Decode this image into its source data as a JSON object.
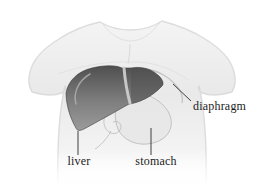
{
  "figure": {
    "type": "anatomical-torso-diagram",
    "labels": {
      "liver": "liver",
      "stomach": "stomach",
      "diaphragm": "diaphragm"
    },
    "colors": {
      "background": "#ffffff",
      "torso_light": "#f4f4f4",
      "torso_mid": "#e9e9e9",
      "torso_edge": "#d7d7d7",
      "liver_top": "#4f4f4f",
      "liver_mid": "#7e7e7e",
      "liver_bottom": "#9b9b9b",
      "liver_outline": "#3c3c3c",
      "falciform_ligament": "#cccccc",
      "liver_highlight": "#b2b2b2",
      "stomach_fill": "#e6e6e6",
      "stomach_outline": "#bcbcbc",
      "diaphragm_line": "#c0c0c0",
      "leader_line": "#3f3f3f",
      "label_text": "#1b1b1b"
    }
  }
}
